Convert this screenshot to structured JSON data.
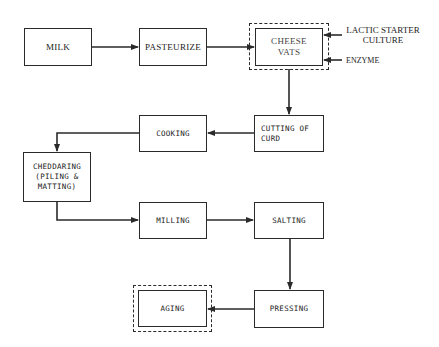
{
  "diagram": {
    "nodes": {
      "milk": "MILK",
      "pasteurize": "PASTEURIZE",
      "cheese_vats": "CHEESE VATS",
      "cutting_of_curd": "CUTTING OF CURD",
      "cooking": "COOKING",
      "cheddaring": "CHEDDARING (PILING & MATTING)",
      "milling": "MILLING",
      "salting": "SALTING",
      "pressing": "PRESSING",
      "aging": "AGING"
    },
    "inputs": {
      "lactic_starter_culture": "LACTIC STARTER CULTURE",
      "enzyme": "ENZYME"
    },
    "edges": [
      [
        "MILK",
        "PASTEURIZE"
      ],
      [
        "PASTEURIZE",
        "CHEESE VATS"
      ],
      [
        "LACTIC STARTER CULTURE",
        "CHEESE VATS"
      ],
      [
        "ENZYME",
        "CHEESE VATS"
      ],
      [
        "CHEESE VATS",
        "CUTTING OF CURD"
      ],
      [
        "CUTTING OF CURD",
        "COOKING"
      ],
      [
        "COOKING",
        "CHEDDARING (PILING & MATTING)"
      ],
      [
        "CHEDDARING (PILING & MATTING)",
        "MILLING"
      ],
      [
        "MILLING",
        "SALTING"
      ],
      [
        "SALTING",
        "PRESSING"
      ],
      [
        "PRESSING",
        "AGING"
      ]
    ],
    "highlighted_nodes": [
      "CHEESE VATS",
      "AGING"
    ],
    "line_color": "#2a2a2a"
  }
}
